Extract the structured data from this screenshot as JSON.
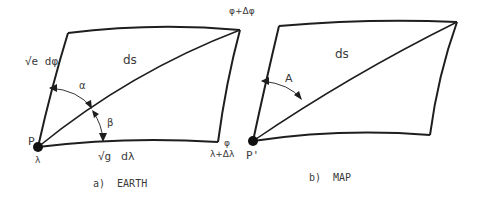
{
  "figure": {
    "type": "diagram"
  },
  "panel_a": {
    "caption": "a)  EARTH",
    "labels": {
      "side_meridian": "√e dφ",
      "diagonal": "ds",
      "angle_alpha": "α",
      "angle_beta": "β",
      "point": "P",
      "point_lambda": "λ",
      "side_parallel_sqrt": "√g",
      "side_parallel_dlambda": "dλ",
      "corner_top_right": "φ+Δφ",
      "corner_bottom_right_phi": "φ",
      "corner_bottom_right_lambda": "λ+Δλ"
    }
  },
  "panel_b": {
    "caption": "b)  MAP",
    "labels": {
      "diagonal": "ds",
      "angle_A": "A",
      "point": "P'"
    }
  },
  "colors": {
    "line": "#1e1e1e",
    "text": "#3a3a3a",
    "background": "#ffffff"
  }
}
